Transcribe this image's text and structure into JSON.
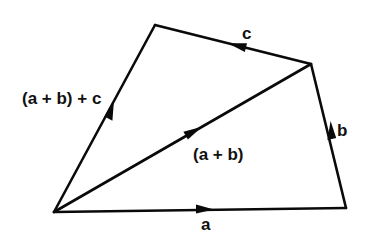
{
  "diagram": {
    "colors": {
      "line": "#0a0a0a",
      "text": "#111111",
      "background": "#ffffff"
    },
    "points": {
      "O": [
        54,
        212
      ],
      "A": [
        346,
        208
      ],
      "B": [
        311,
        64
      ],
      "C": [
        155,
        25
      ]
    },
    "vectors": [
      {
        "id": "a",
        "from": "O",
        "to": "A",
        "label": "a"
      },
      {
        "id": "b",
        "from": "A",
        "to": "B",
        "label": "b"
      },
      {
        "id": "c",
        "from": "B",
        "to": "C",
        "label": "c"
      },
      {
        "id": "a_plus_b",
        "from": "O",
        "to": "B",
        "label": "(a + b)"
      },
      {
        "id": "sum",
        "from": "O",
        "to": "C",
        "label": "(a + b) + c"
      }
    ]
  },
  "labels": {
    "a": "a",
    "b": "b",
    "c": "c",
    "a_plus_b": "(a + b)",
    "sum": "(a + b) + c"
  }
}
